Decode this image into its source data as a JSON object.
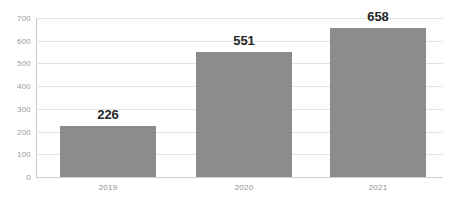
{
  "chart_data": {
    "type": "bar",
    "title": "",
    "subtitle": "",
    "xlabel": "",
    "ylabel": "",
    "categories": [
      "2019",
      "2020",
      "2021"
    ],
    "values": [
      226,
      551,
      658
    ],
    "data_labels": [
      "226",
      "551",
      "658"
    ],
    "ylim": [
      0,
      700
    ],
    "yticks": [
      0,
      100,
      200,
      300,
      400,
      500,
      600,
      700
    ],
    "ytick_labels": [
      "0",
      "100",
      "200",
      "300",
      "400",
      "500",
      "600",
      "700"
    ],
    "grid": true,
    "grid_axis": "y",
    "legend": false,
    "legend_position": "none",
    "series": [
      {
        "name": "",
        "values": [
          226,
          551,
          658
        ],
        "color": "#8c8c8c"
      }
    ]
  },
  "style": {
    "background_color": "#ffffff",
    "bar_color": "#8c8c8c",
    "gridline_color": "#e3e3e3",
    "axis_color": "#c8c8c8",
    "baseline_color": "#d0d0d0",
    "ytick_label_color": "#9a9a9a",
    "xtick_label_color": "#8f8f8f",
    "value_label_color": "#262626"
  }
}
